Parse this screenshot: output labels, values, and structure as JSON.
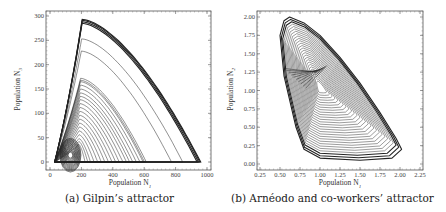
{
  "chart_data": [
    {
      "type": "line",
      "title": "",
      "caption": "(a) Gilpin’s attractor",
      "xlabel": "Population N1",
      "ylabel": "Population N3",
      "xlim": [
        0,
        1000
      ],
      "ylim": [
        0,
        300
      ],
      "xticks": [
        0,
        200,
        400,
        600,
        800,
        1000
      ],
      "yticks": [
        0,
        50,
        100,
        150,
        200,
        250,
        300
      ],
      "grid": false,
      "legend": null,
      "description": "Phase-space trajectory: nested arcs starting near N1≈30, rising to a peak near N1≈200 (max N3≈293), descending to N1≈960 at N3≈0; dense small loops near (130,15).",
      "series": [
        {
          "name": "outer arc",
          "x": [
            30,
            60,
            100,
            150,
            200,
            300,
            400,
            500,
            600,
            700,
            800,
            900,
            960
          ],
          "y": [
            0,
            150,
            250,
            285,
            293,
            280,
            245,
            200,
            155,
            110,
            70,
            30,
            0
          ]
        },
        {
          "name": "arc 250",
          "x": [
            30,
            80,
            150,
            200,
            300,
            400,
            500,
            600,
            700,
            760
          ],
          "y": [
            0,
            180,
            245,
            253,
            240,
            205,
            160,
            110,
            50,
            0
          ]
        },
        {
          "name": "arc 228",
          "x": [
            30,
            80,
            150,
            200,
            300,
            400,
            500,
            600,
            700
          ],
          "y": [
            0,
            170,
            220,
            228,
            215,
            180,
            130,
            70,
            0
          ]
        },
        {
          "name": "arc 170",
          "x": [
            30,
            80,
            130,
            200,
            300,
            400,
            500,
            580
          ],
          "y": [
            0,
            130,
            165,
            172,
            150,
            110,
            55,
            0
          ]
        },
        {
          "name": "inner loops",
          "x": [
            80,
            100,
            130,
            160,
            180
          ],
          "y": [
            5,
            25,
            30,
            25,
            5
          ]
        }
      ]
    },
    {
      "type": "line",
      "title": "",
      "caption": "(b) Arnéodo and co-workers’ attractor",
      "xlabel": "Population N1",
      "ylabel": "Population N2",
      "xlim": [
        0.25,
        2.25
      ],
      "ylim": [
        0.0,
        2.0
      ],
      "xticks": [
        0.25,
        0.5,
        0.75,
        1.0,
        1.25,
        1.5,
        1.75,
        2.0,
        2.25
      ],
      "yticks": [
        0.0,
        0.25,
        0.5,
        0.75,
        1.0,
        1.25,
        1.5,
        1.75,
        2.0
      ],
      "grid": false,
      "legend": null,
      "description": "Chaotic spiral attractor: outer boundary peaks near (0.62, 2.0), sweeps down-right to (2.0, 0.2), bottom near N2≈0.05, left edge from (0.5, 1.8) down to (0.75, 0.2); inner spirals converge around (1.0, 1.05) with a fold near (0.9, 1.25).",
      "series": [
        {
          "name": "outer boundary",
          "x": [
            0.5,
            0.55,
            0.62,
            0.8,
            1.0,
            1.25,
            1.5,
            1.75,
            1.95,
            2.02,
            1.9,
            1.5,
            1.0,
            0.8,
            0.7,
            0.55,
            0.5
          ],
          "y": [
            1.75,
            1.95,
            2.0,
            1.92,
            1.75,
            1.45,
            1.1,
            0.7,
            0.35,
            0.2,
            0.08,
            0.05,
            0.08,
            0.2,
            0.5,
            1.2,
            1.75
          ]
        },
        {
          "name": "inner spiral",
          "x": [
            0.85,
            0.95,
            1.05,
            1.1,
            1.05,
            0.95,
            0.88,
            0.85
          ],
          "y": [
            1.05,
            1.2,
            1.15,
            1.02,
            0.9,
            0.88,
            0.95,
            1.05
          ]
        }
      ]
    }
  ],
  "panels": {
    "left": {
      "caption": "(a) Gilpin’s attractor",
      "xlabel_text": "Population N",
      "xlabel_sub": "1",
      "ylabel_text": "Population N",
      "ylabel_sub": "3",
      "xticks": [
        "0",
        "200",
        "400",
        "600",
        "800",
        "1000"
      ],
      "yticks": [
        "0",
        "50",
        "100",
        "150",
        "200",
        "250",
        "300"
      ]
    },
    "right": {
      "caption": "(b) Arnéodo and co-workers’ attractor",
      "xlabel_text": "Population N",
      "xlabel_sub": "1",
      "ylabel_text": "Population N",
      "ylabel_sub": "2",
      "xticks": [
        "0.25",
        "0.50",
        "0.75",
        "1.00",
        "1.25",
        "1.50",
        "1.75",
        "2.00",
        "2.25"
      ],
      "yticks": [
        "0.00",
        "0.25",
        "0.50",
        "0.75",
        "1.00",
        "1.25",
        "1.50",
        "1.75",
        "2.00"
      ]
    }
  }
}
